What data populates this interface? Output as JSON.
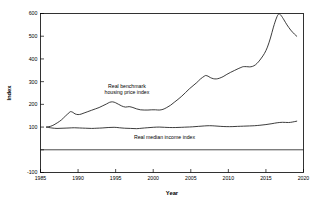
{
  "chart_data": {
    "type": "line",
    "title": "",
    "xlabel": "Year",
    "ylabel": "Index",
    "xlim": [
      1985,
      2020
    ],
    "ylim": [
      -100,
      600
    ],
    "grid": false,
    "legend": "annotations-inline",
    "xticks": [
      "1985",
      "1990",
      "1995",
      "2000",
      "2005",
      "2010",
      "2015",
      "2020"
    ],
    "xtick_values": [
      1985,
      1990,
      1995,
      2000,
      2005,
      2010,
      2015,
      2020
    ],
    "yticks": [
      "600",
      "500",
      "400",
      "300",
      "200",
      "100",
      "-100"
    ],
    "ytick_values": [
      600,
      500,
      400,
      300,
      200,
      100,
      -100
    ],
    "ytick_values_all": [
      600,
      500,
      400,
      300,
      200,
      100,
      0,
      -100
    ],
    "annotations": [
      {
        "name": "housing-series-annotation",
        "text_line_1": "Real benchmark",
        "text_line_2": "housing price index",
        "x": 1996.5,
        "y": 272
      },
      {
        "name": "income-series-annotation",
        "text_line_1": "Real median income index",
        "x": 2001.5,
        "y": 48
      }
    ],
    "series": [
      {
        "name": "Real benchmark housing price index",
        "color": "#1a1a1a",
        "x": [
          1985.8,
          1986.3,
          1986.8,
          1987.3,
          1987.8,
          1988.3,
          1988.8,
          1989.0,
          1989.3,
          1989.6,
          1990.0,
          1990.4,
          1990.8,
          1991.3,
          1991.8,
          1992.3,
          1992.8,
          1993.3,
          1993.8,
          1994.2,
          1994.6,
          1995.0,
          1995.4,
          1995.8,
          1996.3,
          1996.8,
          1997.3,
          1997.8,
          1998.3,
          1998.8,
          1999.3,
          1999.8,
          2000.3,
          2000.8,
          2001.3,
          2001.8,
          2002.3,
          2002.8,
          2003.3,
          2003.8,
          2004.3,
          2004.8,
          2005.3,
          2005.8,
          2006.3,
          2006.8,
          2007.0,
          2007.3,
          2007.6,
          2008.0,
          2008.4,
          2008.8,
          2009.3,
          2009.8,
          2010.3,
          2010.8,
          2011.3,
          2011.8,
          2012.0,
          2012.4,
          2012.8,
          2013.2,
          2013.6,
          2014.0,
          2014.4,
          2014.8,
          2015.2,
          2015.6,
          2016.0,
          2016.4,
          2016.7,
          2017.0,
          2017.4,
          2017.8,
          2018.3,
          2018.8,
          2019.1
        ],
        "y": [
          100,
          103,
          110,
          120,
          132,
          148,
          163,
          168,
          165,
          158,
          155,
          157,
          162,
          168,
          174,
          180,
          186,
          194,
          202,
          209,
          211,
          207,
          200,
          193,
          188,
          190,
          186,
          180,
          176,
          175,
          175,
          176,
          176,
          175,
          178,
          186,
          196,
          209,
          222,
          236,
          252,
          268,
          282,
          296,
          312,
          324,
          327,
          324,
          318,
          313,
          312,
          315,
          322,
          332,
          341,
          349,
          357,
          364,
          366,
          366,
          365,
          367,
          374,
          387,
          404,
          424,
          452,
          492,
          540,
          580,
          598,
          592,
          572,
          550,
          527,
          509,
          500
        ]
      },
      {
        "name": "Real median income index",
        "color": "#1a1a1a",
        "x": [
          1985.8,
          1986.5,
          1987.2,
          1988.0,
          1988.8,
          1989.5,
          1990.2,
          1991.0,
          1991.8,
          1992.5,
          1993.2,
          1994.0,
          1994.8,
          1995.5,
          1996.2,
          1997.0,
          1997.8,
          1998.5,
          1999.2,
          2000.0,
          2000.8,
          2001.5,
          2002.2,
          2003.0,
          2003.8,
          2004.5,
          2005.2,
          2006.0,
          2006.8,
          2007.5,
          2008.2,
          2009.0,
          2009.8,
          2010.5,
          2011.2,
          2012.0,
          2012.8,
          2013.5,
          2014.2,
          2015.0,
          2015.8,
          2016.5,
          2017.2,
          2018.0,
          2018.5,
          2019.1
        ],
        "y": [
          100,
          96,
          94,
          95,
          96,
          97,
          96,
          95,
          94,
          95,
          96,
          98,
          99,
          97,
          95,
          94,
          93,
          95,
          97,
          99,
          100,
          99,
          98,
          98,
          99,
          100,
          101,
          103,
          105,
          106,
          105,
          103,
          102,
          102,
          103,
          104,
          105,
          106,
          108,
          111,
          115,
          119,
          121,
          120,
          122,
          126
        ]
      }
    ]
  }
}
